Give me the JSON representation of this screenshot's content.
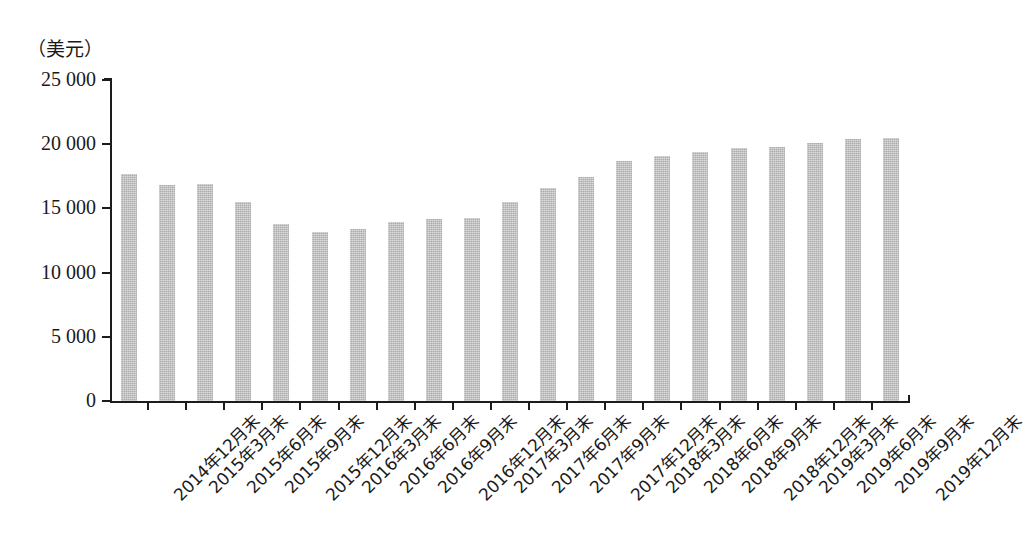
{
  "chart_data": {
    "type": "bar",
    "title": "",
    "subtitle": "",
    "xlabel": "",
    "ylabel": "（美元）",
    "ylim": [
      0,
      25000
    ],
    "ytick_labels": [
      "25 000",
      "20 000",
      "15 000",
      "10 000",
      "5 000",
      "0"
    ],
    "ytick_values": [
      25000,
      20000,
      15000,
      10000,
      5000,
      0
    ],
    "grid": false,
    "legend": false,
    "bar_color": "#bdbdbd",
    "axis_color": "#1c1c1c",
    "categories": [
      "2014年12月末",
      "2015年3月末",
      "2015年6月末",
      "2015年9月末",
      "2015年12月末",
      "2016年3月末",
      "2016年6月末",
      "2016年9月末",
      "2016年12月末",
      "2017年3月末",
      "2017年6月末",
      "2017年9月末",
      "2017年12月末",
      "2018年3月末",
      "2018年6月末",
      "2018年9月末",
      "2018年12月末",
      "2019年3月末",
      "2019年6月末",
      "2019年9月末",
      "2019年12月末"
    ],
    "values": [
      17700,
      16800,
      16900,
      15500,
      13750,
      13150,
      13400,
      13950,
      14150,
      14250,
      15500,
      16600,
      17450,
      18700,
      19100,
      19400,
      19700,
      19750,
      20100,
      20400,
      20500
    ]
  }
}
